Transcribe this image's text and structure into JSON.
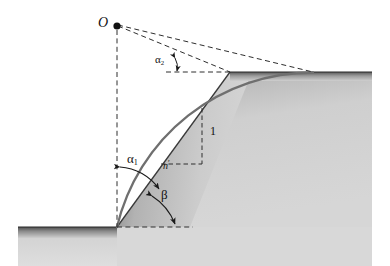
{
  "figure": {
    "type": "engineering-diagram",
    "width": 390,
    "height": 266,
    "background_color": "#ffffff"
  },
  "labels": {
    "center_point": "O",
    "alpha1": "α",
    "alpha1_sub": "1",
    "alpha2": "α",
    "alpha2_sub": "2",
    "beta": "β",
    "vertical_unit": "1",
    "horizontal_unit": "n",
    "horizontal_unit_prime": "′"
  },
  "geometry": {
    "center_O": [
      117,
      26
    ],
    "toe": [
      117,
      227
    ],
    "crest": [
      230,
      72
    ],
    "arc_top_end": [
      313,
      73
    ],
    "arc_radius": 201,
    "lower_ground_y": 227,
    "upper_ground_y": 72,
    "lower_ground_left_x": 18,
    "upper_ground_right_x": 372,
    "slope_face_from": [
      117,
      227
    ],
    "slope_face_to": [
      230,
      72
    ],
    "unit_triangle_corner": [
      202,
      164
    ],
    "unit_triangle_top": [
      202,
      110
    ],
    "alpha2_vertex": [
      168,
      72
    ]
  },
  "colors": {
    "soil_fill_light": "#d2d2d2",
    "soil_fill_dark": "#9a9a9a",
    "ground_band_dark": "#5f5f5f",
    "slip_arc": "#6e6e6e",
    "line_stroke": "#1a1a1a",
    "dashed_stroke": "#333333",
    "text": "#111111"
  },
  "elements": {
    "slip_surface_name": "circular slip arc",
    "slope_face_name": "slope face",
    "upper_ground_name": "upper ground surface",
    "lower_ground_name": "lower ground surface",
    "radius_ray_crest_name": "radius to crest",
    "radius_ray_arc_name": "radius to arc exit",
    "vertical_axis_name": "vertical reference line"
  }
}
